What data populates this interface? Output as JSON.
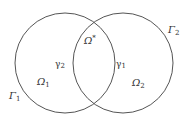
{
  "diagram": {
    "stroke_color": "#555555",
    "text_color": "#333333",
    "circles": [
      {
        "name": "left",
        "cx": 65,
        "cy": 63,
        "r": 50
      },
      {
        "name": "right",
        "cx": 123,
        "cy": 63,
        "r": 50
      }
    ],
    "labels": {
      "omega_star": {
        "base": "Ω",
        "sup": "*"
      },
      "omega_1": {
        "base": "Ω",
        "sub": "1"
      },
      "omega_2": {
        "base": "Ω",
        "sub": "2"
      },
      "gamma_1": {
        "base": "γ",
        "sub": "1"
      },
      "gamma_2": {
        "base": "γ",
        "sub": "2"
      },
      "Gamma_1": {
        "base": "Γ",
        "sub": "1"
      },
      "Gamma_2": {
        "base": "Γ",
        "sub": "2"
      }
    }
  }
}
